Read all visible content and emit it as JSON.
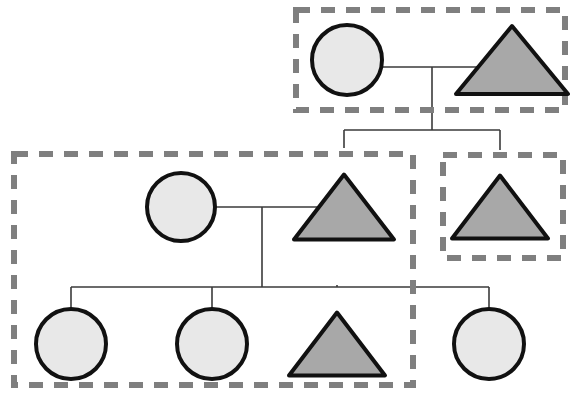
{
  "diagram": {
    "type": "pedigree",
    "width": 584,
    "height": 412,
    "background_color": "#ffffff",
    "legend": {
      "circle_meaning": "female",
      "triangle_meaning": "male",
      "light_fill_meaning": "unaffected",
      "dark_fill_meaning": "affected",
      "dashed_box_meaning": "household grouping"
    },
    "style": {
      "shape_stroke_color": "#111111",
      "shape_stroke_width": 4,
      "circle_fill": "#e8e8e8",
      "triangle_fill": "#a8a8a8",
      "connector_color": "#3a3a3a",
      "connector_width": 1.6,
      "group_box_color": "#7f7f7f",
      "group_box_width": 6,
      "group_box_dash": "14 11"
    },
    "generation_count": 3,
    "individual_count": 9,
    "group_box_count": 3
  },
  "individuals": [
    {
      "id": "I-1",
      "shape": "circle",
      "sex": "female",
      "affected": false,
      "fill": "#e8e8e8",
      "generation": 1,
      "cx": 347,
      "cy": 60,
      "r": 35
    },
    {
      "id": "I-2",
      "shape": "triangle",
      "sex": "male",
      "affected": true,
      "fill": "#a8a8a8",
      "generation": 1,
      "cx": 512,
      "cy": 60,
      "half_width": 56,
      "height": 68
    },
    {
      "id": "II-1",
      "shape": "circle",
      "sex": "female",
      "affected": false,
      "fill": "#e8e8e8",
      "generation": 2,
      "cx": 181,
      "cy": 207,
      "r": 34
    },
    {
      "id": "II-2",
      "shape": "triangle",
      "sex": "male",
      "affected": true,
      "fill": "#a8a8a8",
      "generation": 2,
      "cx": 344,
      "cy": 207,
      "half_width": 50,
      "height": 65
    },
    {
      "id": "II-3",
      "shape": "triangle",
      "sex": "male",
      "affected": true,
      "fill": "#a8a8a8",
      "generation": 2,
      "cx": 500,
      "cy": 207,
      "half_width": 48,
      "height": 63
    },
    {
      "id": "III-1",
      "shape": "circle",
      "sex": "female",
      "affected": false,
      "fill": "#e8e8e8",
      "generation": 3,
      "cx": 71,
      "cy": 344,
      "r": 35
    },
    {
      "id": "III-2",
      "shape": "circle",
      "sex": "female",
      "affected": false,
      "fill": "#e8e8e8",
      "generation": 3,
      "cx": 212,
      "cy": 344,
      "r": 35
    },
    {
      "id": "III-3",
      "shape": "triangle",
      "sex": "male",
      "affected": true,
      "fill": "#a8a8a8",
      "generation": 3,
      "cx": 337,
      "cy": 344,
      "half_width": 48,
      "height": 63
    },
    {
      "id": "III-4",
      "shape": "circle",
      "sex": "female",
      "affected": false,
      "fill": "#e8e8e8",
      "generation": 3,
      "cx": 489,
      "cy": 344,
      "r": 35
    }
  ],
  "connectors": [
    {
      "id": "mating-line-gen1",
      "type": "mating-line",
      "points": "382,67 512,67"
    },
    {
      "id": "descent-drop-gen1",
      "type": "descent-line",
      "points": "432,67 432,130"
    },
    {
      "id": "sibship-bar-gen2",
      "type": "sibship-bar",
      "points": "344,130 500,130"
    },
    {
      "id": "sib-drop-II-2",
      "type": "descent-line",
      "points": "344,130 344,148"
    },
    {
      "id": "sib-drop-II-3",
      "type": "descent-line",
      "points": "500,130 500,150"
    },
    {
      "id": "mating-line-gen2",
      "type": "mating-line",
      "points": "215,207 344,207"
    },
    {
      "id": "descent-drop-gen2",
      "type": "descent-line",
      "points": "262,207 262,287"
    },
    {
      "id": "sibship-bar-gen3",
      "type": "sibship-bar",
      "points": "71,287 489,287"
    },
    {
      "id": "sib-drop-III-1",
      "type": "descent-line",
      "points": "71,287 71,311"
    },
    {
      "id": "sib-drop-III-2",
      "type": "descent-line",
      "points": "212,287 212,311"
    },
    {
      "id": "sib-drop-III-3",
      "type": "descent-line",
      "points": "337,287 337,285"
    },
    {
      "id": "sib-drop-III-4",
      "type": "descent-line",
      "points": "489,287 489,311"
    }
  ],
  "group_boxes": [
    {
      "id": "group-1",
      "label": "top household",
      "x": 296,
      "y": 10,
      "width": 269,
      "height": 100,
      "members": [
        "I-1",
        "I-2"
      ]
    },
    {
      "id": "group-2",
      "label": "left household",
      "x": 14,
      "y": 154,
      "width": 399,
      "height": 231,
      "members": [
        "II-1",
        "II-2",
        "III-1",
        "III-2",
        "III-3"
      ]
    },
    {
      "id": "group-3",
      "label": "right household",
      "x": 443,
      "y": 155,
      "width": 120,
      "height": 103,
      "members": [
        "II-3"
      ]
    }
  ]
}
